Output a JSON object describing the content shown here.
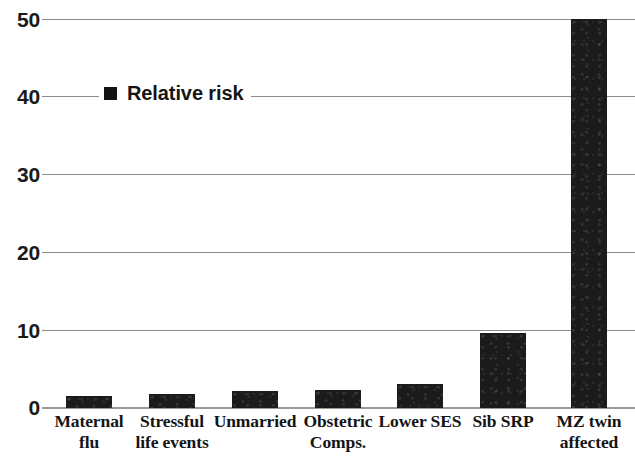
{
  "chart_data": {
    "type": "bar",
    "title": "",
    "subtitle": "",
    "xlabel": "",
    "ylabel": "",
    "ylim": [
      0,
      50
    ],
    "yticks": [
      0,
      10,
      20,
      30,
      40,
      50
    ],
    "ytick_labels": [
      "0",
      "10",
      "20",
      "30",
      "40",
      "50"
    ],
    "grid": true,
    "grid_axis": "y",
    "legend": {
      "position": "upper-left-inside",
      "entries": [
        {
          "name": "Relative risk",
          "marker": "filled-square",
          "color": "#141414"
        }
      ]
    },
    "categories": [
      "Maternal flu",
      "Stressful life events",
      "Unmarried",
      "Obstetric Comps.",
      "Lower SES",
      "Sib SRP",
      "MZ twin affected"
    ],
    "category_lines": [
      [
        "Maternal",
        "flu"
      ],
      [
        "Stressful",
        "life events"
      ],
      [
        "Unmarried",
        ""
      ],
      [
        "Obstetric",
        "Comps."
      ],
      [
        "Lower SES",
        ""
      ],
      [
        "Sib SRP",
        ""
      ],
      [
        "MZ twin",
        "affected"
      ]
    ],
    "series": [
      {
        "name": "Relative risk",
        "color": "#1b1b1b",
        "values": [
          1.5,
          1.8,
          2.2,
          2.3,
          3.1,
          9.7,
          50.0
        ]
      }
    ]
  },
  "legend": {
    "label": "Relative risk"
  },
  "axis": {
    "y_tick_0": "0",
    "y_tick_1": "10",
    "y_tick_2": "20",
    "y_tick_3": "30",
    "y_tick_4": "40",
    "y_tick_5": "50"
  },
  "xlabels": [
    {
      "line1": "Maternal",
      "line2": "flu"
    },
    {
      "line1": "Stressful",
      "line2": "life events"
    },
    {
      "line1": "Unmarried",
      "line2": ""
    },
    {
      "line1": "Obstetric",
      "line2": "Comps."
    },
    {
      "line1": "Lower SES",
      "line2": ""
    },
    {
      "line1": "Sib SRP",
      "line2": ""
    },
    {
      "line1": "MZ twin",
      "line2": "affected"
    }
  ]
}
